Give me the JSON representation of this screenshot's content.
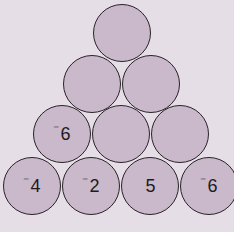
{
  "diagram": {
    "type": "number-pyramid",
    "rows": [
      {
        "cells": [
          {
            "value": "",
            "neg": ""
          }
        ]
      },
      {
        "cells": [
          {
            "value": "",
            "neg": ""
          },
          {
            "value": "",
            "neg": ""
          }
        ]
      },
      {
        "cells": [
          {
            "value": "6",
            "neg": "⁻"
          },
          {
            "value": "",
            "neg": ""
          },
          {
            "value": "",
            "neg": ""
          }
        ]
      },
      {
        "cells": [
          {
            "value": "4",
            "neg": "⁻"
          },
          {
            "value": "2",
            "neg": "⁻"
          },
          {
            "value": "5",
            "neg": ""
          },
          {
            "value": "6",
            "neg": "⁻"
          }
        ]
      }
    ],
    "colors": {
      "background": "#e5dee6",
      "circle_fill": "#c9b9ca",
      "circle_stroke": "#2a2228"
    }
  }
}
